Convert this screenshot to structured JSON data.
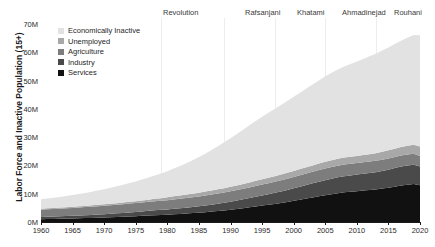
{
  "chart_data": {
    "type": "area",
    "stacked": true,
    "title": "",
    "subtitle": "",
    "xlabel": "",
    "ylabel": "Labor Force and Inactive Population (15+)",
    "xlim": [
      1960,
      2020
    ],
    "ylim": [
      0,
      70
    ],
    "y_unit": "M",
    "grid": false,
    "legend_position": "upper-left-inside",
    "x_tick_labels": [
      "1960",
      "1965",
      "1970",
      "1975",
      "1980",
      "1985",
      "1990",
      "1995",
      "2000",
      "2005",
      "2010",
      "2015",
      "2020"
    ],
    "x_ticks": [
      1960,
      1965,
      1970,
      1975,
      1980,
      1985,
      1990,
      1995,
      2000,
      2005,
      2010,
      2015,
      2020
    ],
    "y_tick_labels": [
      "0M",
      "10M",
      "20M",
      "30M",
      "40M",
      "50M",
      "60M",
      "70M"
    ],
    "y_ticks": [
      0,
      10,
      20,
      30,
      40,
      50,
      60,
      70
    ],
    "x": [
      1960,
      1961,
      1962,
      1963,
      1964,
      1965,
      1966,
      1967,
      1968,
      1969,
      1970,
      1971,
      1972,
      1973,
      1974,
      1975,
      1976,
      1977,
      1978,
      1979,
      1980,
      1981,
      1982,
      1983,
      1984,
      1985,
      1986,
      1987,
      1988,
      1989,
      1990,
      1991,
      1992,
      1993,
      1994,
      1995,
      1996,
      1997,
      1998,
      1999,
      2000,
      2001,
      2002,
      2003,
      2004,
      2005,
      2006,
      2007,
      2008,
      2009,
      2010,
      2011,
      2012,
      2013,
      2014,
      2015,
      2016,
      2017,
      2018,
      2019,
      2020
    ],
    "series": [
      {
        "name": "Services",
        "color": "#111111",
        "order": 1,
        "values": [
          1.0,
          1.05,
          1.1,
          1.15,
          1.2,
          1.26,
          1.32,
          1.38,
          1.45,
          1.52,
          1.6,
          1.68,
          1.77,
          1.86,
          1.96,
          2.06,
          2.17,
          2.28,
          2.4,
          2.5,
          2.6,
          2.72,
          2.85,
          2.99,
          3.14,
          3.3,
          3.48,
          3.67,
          3.88,
          4.1,
          4.35,
          4.62,
          4.9,
          5.2,
          5.5,
          5.8,
          6.1,
          6.4,
          6.75,
          7.1,
          7.5,
          7.9,
          8.3,
          8.7,
          9.1,
          9.5,
          9.85,
          10.2,
          10.5,
          10.7,
          10.9,
          11.1,
          11.3,
          11.5,
          11.8,
          12.1,
          12.5,
          12.9,
          13.2,
          13.4,
          13.0
        ]
      },
      {
        "name": "Industry",
        "color": "#4a4a4a",
        "order": 2,
        "values": [
          0.75,
          0.78,
          0.81,
          0.84,
          0.88,
          0.92,
          0.96,
          1.0,
          1.05,
          1.1,
          1.16,
          1.22,
          1.28,
          1.35,
          1.42,
          1.5,
          1.58,
          1.66,
          1.74,
          1.8,
          1.86,
          1.93,
          2.0,
          2.08,
          2.17,
          2.26,
          2.36,
          2.47,
          2.58,
          2.7,
          2.83,
          2.97,
          3.11,
          3.26,
          3.42,
          3.58,
          3.74,
          3.9,
          4.07,
          4.24,
          4.42,
          4.6,
          4.78,
          4.96,
          5.14,
          5.3,
          5.45,
          5.58,
          5.7,
          5.78,
          5.85,
          5.92,
          6.0,
          6.1,
          6.25,
          6.4,
          6.55,
          6.7,
          6.8,
          6.85,
          6.6
        ]
      },
      {
        "name": "Agriculture",
        "color": "#7d7d7d",
        "order": 3,
        "values": [
          2.6,
          2.64,
          2.68,
          2.72,
          2.76,
          2.8,
          2.84,
          2.88,
          2.92,
          2.96,
          3.0,
          3.03,
          3.06,
          3.09,
          3.12,
          3.15,
          3.18,
          3.2,
          3.22,
          3.24,
          3.26,
          3.3,
          3.34,
          3.38,
          3.42,
          3.46,
          3.5,
          3.54,
          3.58,
          3.62,
          3.66,
          3.7,
          3.74,
          3.78,
          3.82,
          3.86,
          3.9,
          3.93,
          3.96,
          3.99,
          4.02,
          4.05,
          4.08,
          4.1,
          4.12,
          4.14,
          4.15,
          4.15,
          4.14,
          4.12,
          4.1,
          4.08,
          4.05,
          4.02,
          4.0,
          3.98,
          3.95,
          3.92,
          3.88,
          3.84,
          3.7
        ]
      },
      {
        "name": "Unemployed",
        "color": "#a8a8a8",
        "order": 4,
        "values": [
          0.35,
          0.36,
          0.37,
          0.38,
          0.39,
          0.4,
          0.42,
          0.44,
          0.46,
          0.48,
          0.5,
          0.53,
          0.56,
          0.59,
          0.62,
          0.65,
          0.7,
          0.75,
          0.82,
          0.9,
          1.0,
          1.12,
          1.2,
          1.25,
          1.3,
          1.35,
          1.4,
          1.45,
          1.5,
          1.55,
          1.6,
          1.65,
          1.7,
          1.75,
          1.8,
          1.85,
          1.9,
          1.95,
          2.0,
          2.05,
          2.1,
          2.15,
          2.2,
          2.25,
          2.3,
          2.35,
          2.4,
          2.42,
          2.44,
          2.46,
          2.5,
          2.55,
          2.62,
          2.7,
          2.78,
          2.85,
          2.92,
          3.0,
          3.1,
          3.2,
          3.4
        ]
      },
      {
        "name": "Economically Inactive",
        "color": "#e2e2e2",
        "order": 5,
        "values": [
          3.3,
          3.45,
          3.6,
          3.78,
          3.95,
          4.15,
          4.35,
          4.58,
          4.82,
          5.08,
          5.35,
          5.65,
          5.95,
          6.3,
          6.65,
          7.0,
          7.4,
          7.8,
          8.25,
          8.7,
          9.2,
          9.8,
          10.4,
          11.1,
          11.8,
          12.6,
          13.4,
          14.3,
          15.2,
          16.2,
          17.2,
          18.2,
          19.2,
          20.2,
          21.2,
          22.1,
          23.0,
          23.8,
          24.6,
          25.4,
          26.2,
          27.0,
          27.8,
          28.6,
          29.4,
          30.2,
          30.9,
          31.6,
          32.2,
          32.8,
          33.4,
          34.0,
          34.6,
          35.2,
          35.8,
          36.4,
          37.0,
          37.6,
          38.2,
          38.8,
          39.3
        ]
      }
    ],
    "totals_note": "Total rises from about 8M in 1960 to about 66M in 2020",
    "annotations": [
      {
        "label": "Revolution",
        "year": 1979,
        "label_x_px": 163
      },
      {
        "label": "Rafsanjani",
        "year": 1989,
        "label_x_px": 245
      },
      {
        "label": "Khatami",
        "year": 1997,
        "label_x_px": 297
      },
      {
        "label": "Ahmadinejad",
        "year": 2005,
        "label_x_px": 342
      },
      {
        "label": "Rouhani",
        "year": 2013,
        "label_x_px": 394
      }
    ]
  },
  "legend": {
    "items": [
      {
        "label": "Economically Inactive",
        "color": "#e2e2e2"
      },
      {
        "label": "Unemployed",
        "color": "#a8a8a8"
      },
      {
        "label": "Agriculture",
        "color": "#7d7d7d"
      },
      {
        "label": "Industry",
        "color": "#4a4a4a"
      },
      {
        "label": "Services",
        "color": "#111111"
      }
    ]
  }
}
